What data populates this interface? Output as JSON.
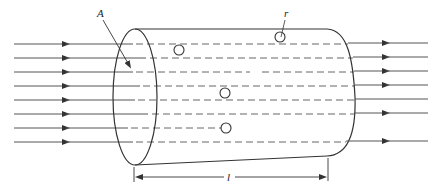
{
  "diagram": {
    "labels": {
      "area": "A",
      "radius": "r",
      "length": "l"
    },
    "incoming_lines": [
      44,
      58,
      72,
      86,
      100,
      114,
      128,
      142
    ],
    "outgoing_lines": [
      {
        "y": 44,
        "arrow": true
      },
      {
        "y": 58,
        "arrow": true
      },
      {
        "y": 72,
        "arrow": true
      },
      {
        "y": 86,
        "arrow": true
      },
      {
        "y": 100,
        "arrow": false
      },
      {
        "y": 114,
        "arrow": true
      },
      {
        "y": 142,
        "arrow": true
      }
    ],
    "scatterers": [
      {
        "cx": 179,
        "cy": 50
      },
      {
        "cx": 280,
        "cy": 37
      },
      {
        "cx": 225,
        "cy": 93
      },
      {
        "cx": 226,
        "cy": 128
      }
    ],
    "colors": {
      "stroke": "#333333",
      "line": "#555555",
      "background": "#ffffff"
    }
  }
}
